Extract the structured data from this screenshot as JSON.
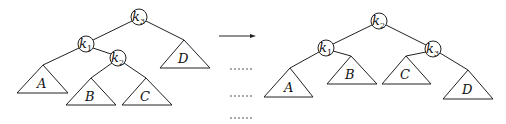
{
  "diagram": {
    "type": "tree-rotation",
    "colors": {
      "stroke": "#222222",
      "fill": "#ffffff",
      "text": "#111111"
    },
    "left_tree": {
      "nodes": [
        {
          "id": "k3",
          "base": "k",
          "sub": "3",
          "x": 139,
          "y": 17
        },
        {
          "id": "k1",
          "base": "k",
          "sub": "1",
          "x": 86,
          "y": 44
        },
        {
          "id": "k2",
          "base": "k",
          "sub": "2",
          "x": 118,
          "y": 58
        }
      ],
      "subtrees": [
        {
          "id": "A",
          "label": "A"
        },
        {
          "id": "B",
          "label": "B"
        },
        {
          "id": "C",
          "label": "C"
        },
        {
          "id": "D",
          "label": "D"
        }
      ],
      "edges": [
        [
          "k3",
          "k1"
        ],
        [
          "k3",
          "D"
        ],
        [
          "k1",
          "A"
        ],
        [
          "k1",
          "k2"
        ],
        [
          "k2",
          "B"
        ],
        [
          "k2",
          "C"
        ]
      ]
    },
    "right_tree": {
      "nodes": [
        {
          "id": "k2",
          "base": "k",
          "sub": "2",
          "x": 379,
          "y": 21
        },
        {
          "id": "k1",
          "base": "k",
          "sub": "1",
          "x": 326,
          "y": 48
        },
        {
          "id": "k3",
          "base": "k",
          "sub": "3",
          "x": 433,
          "y": 49
        }
      ],
      "subtrees": [
        {
          "id": "A",
          "label": "A"
        },
        {
          "id": "B",
          "label": "B"
        },
        {
          "id": "C",
          "label": "C"
        },
        {
          "id": "D",
          "label": "D"
        }
      ],
      "edges": [
        [
          "k2",
          "k1"
        ],
        [
          "k2",
          "k3"
        ],
        [
          "k1",
          "A"
        ],
        [
          "k1",
          "B"
        ],
        [
          "k3",
          "C"
        ],
        [
          "k3",
          "D"
        ]
      ]
    },
    "arrow": {
      "direction": "right",
      "meaning": "transforms-to"
    }
  }
}
